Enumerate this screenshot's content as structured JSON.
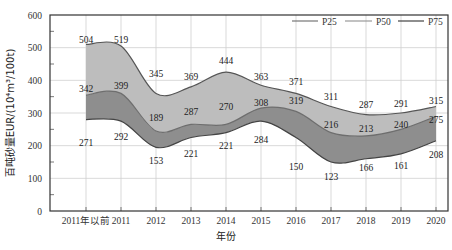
{
  "chart_data": {
    "type": "area",
    "title": "",
    "xlabel": "年份",
    "ylabel": "百吨砂量EUR/(10⁴m³/100t)",
    "ylim": [
      0,
      600
    ],
    "yticks": [
      0,
      100,
      200,
      300,
      400,
      500,
      600
    ],
    "grid": true,
    "legend_position": "top-right",
    "categories": [
      "2011年以前",
      "2011",
      "2012",
      "2013",
      "2014",
      "2015",
      "2016",
      "2017",
      "2018",
      "2019",
      "2020"
    ],
    "series": [
      {
        "name": "P25",
        "values": [
          504,
          519,
          345,
          369,
          444,
          363,
          371,
          311,
          287,
          291,
          315
        ],
        "color": "#b8b8b8"
      },
      {
        "name": "P50",
        "values": [
          342,
          399,
          189,
          287,
          270,
          308,
          319,
          216,
          213,
          240,
          275
        ],
        "color": "#8f8f8f"
      },
      {
        "name": "P75",
        "values": [
          271,
          292,
          153,
          221,
          221,
          284,
          150,
          123,
          166,
          161,
          208
        ],
        "color": "#555555"
      }
    ],
    "curve_values": {
      "P25": [
        510,
        505,
        360,
        380,
        425,
        385,
        360,
        320,
        295,
        300,
        320
      ],
      "P50": [
        355,
        360,
        245,
        265,
        265,
        315,
        305,
        240,
        230,
        250,
        290
      ],
      "P75": [
        280,
        275,
        195,
        225,
        240,
        275,
        225,
        150,
        160,
        175,
        215
      ]
    }
  },
  "legend": {
    "items": [
      {
        "label": "P25"
      },
      {
        "label": "P50"
      },
      {
        "label": "P75"
      }
    ]
  }
}
